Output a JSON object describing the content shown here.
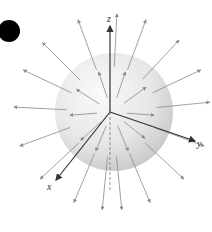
{
  "diagram": {
    "axes": [
      {
        "name": "z",
        "label": "z"
      },
      {
        "name": "y",
        "label": "y"
      },
      {
        "name": "x",
        "label": "x"
      }
    ],
    "marker": "black-dot",
    "colors": {
      "sphere_light": "#f4f4f4",
      "sphere_dark": "#c8c8c8",
      "arrow": "#8a8a8a",
      "axis": "#333333",
      "dot": "#000000"
    },
    "field_directions": [
      [
        0.05,
        -1
      ],
      [
        0.35,
        -0.95
      ],
      [
        -0.35,
        -0.95
      ],
      [
        0.7,
        -0.75
      ],
      [
        -0.7,
        -0.7
      ],
      [
        0.95,
        -0.45
      ],
      [
        -0.95,
        -0.45
      ],
      [
        1,
        -0.1
      ],
      [
        -1,
        -0.05
      ],
      [
        0.95,
        0.35
      ],
      [
        -0.95,
        0.35
      ],
      [
        0.75,
        0.7
      ],
      [
        -0.75,
        0.7
      ],
      [
        0.4,
        0.95
      ],
      [
        -0.4,
        0.95
      ],
      [
        0.1,
        1
      ],
      [
        -0.1,
        1
      ],
      [
        0.55,
        -0.4
      ],
      [
        -0.55,
        -0.35
      ],
      [
        0.5,
        0.4
      ],
      [
        -0.5,
        0.45
      ],
      [
        0.2,
        -0.6
      ],
      [
        -0.2,
        -0.6
      ],
      [
        0.25,
        0.6
      ],
      [
        -0.25,
        0.6
      ],
      [
        0.65,
        0.05
      ],
      [
        -0.65,
        0.05
      ]
    ]
  }
}
